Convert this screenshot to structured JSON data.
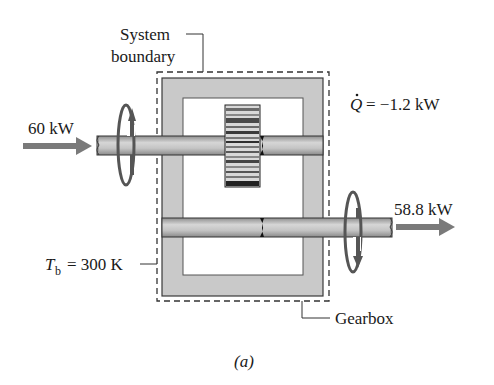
{
  "figure": {
    "caption": "(a)",
    "labels": {
      "system_boundary_line1": "System",
      "system_boundary_line2": "boundary",
      "heat_rate": "= −1.2 kW",
      "heat_symbol": "Q",
      "input_power": "60 kW",
      "output_power": "58.8 kW",
      "boundary_temp_symbol": "T",
      "boundary_temp_subscript": "b",
      "boundary_temp_value": "= 300 K",
      "component": "Gearbox"
    },
    "values": {
      "input_power_kW": 60,
      "output_power_kW": 58.8,
      "heat_transfer_kW": -1.2,
      "boundary_temperature_K": 300
    },
    "colors": {
      "housing": "#c8c8c8",
      "shaft": "#b4b4b4",
      "arrow": "#7a7a7a",
      "outline": "#333333"
    }
  }
}
